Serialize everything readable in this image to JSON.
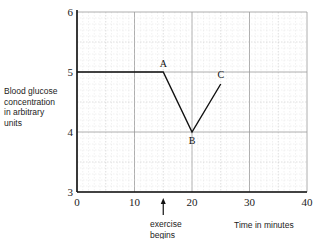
{
  "chart_data": {
    "type": "line",
    "title": "",
    "xlabel": "Time in minutes",
    "ylabel": "Blood glucose concentration in arbitrary units",
    "xlim": [
      0,
      40
    ],
    "ylim": [
      3,
      6
    ],
    "xticks": [
      0,
      10,
      20,
      30,
      40
    ],
    "yticks": [
      3,
      4,
      5,
      6
    ],
    "grid": true,
    "legend": null,
    "series": [
      {
        "name": "Blood glucose",
        "x": [
          0,
          15,
          20,
          25
        ],
        "y": [
          5.0,
          5.0,
          4.0,
          4.8
        ]
      }
    ],
    "point_labels": [
      {
        "label": "A",
        "x": 15,
        "y": 5.0
      },
      {
        "label": "B",
        "x": 20,
        "y": 4.0
      },
      {
        "label": "C",
        "x": 25,
        "y": 4.8
      }
    ],
    "annotations": [
      {
        "text": "exercise begins",
        "x": 15,
        "arrow": "up"
      }
    ]
  },
  "labels": {
    "ylabel_lines": [
      "Blood glucose",
      "concentration",
      "in arbitrary",
      "units"
    ],
    "xlabel": "Time in minutes",
    "annotation_lines": [
      "exercise",
      "begins"
    ],
    "xticks": [
      "0",
      "10",
      "20",
      "30",
      "40"
    ],
    "yticks": [
      "3",
      "4",
      "5",
      "6"
    ],
    "points": [
      "A",
      "B",
      "C"
    ]
  }
}
